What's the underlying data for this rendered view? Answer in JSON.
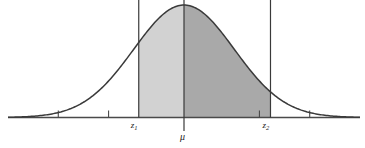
{
  "figure": {
    "kind": "normal-distribution-curve",
    "background": "#ffffff",
    "curve_color": "#3a3a3a",
    "axis_color": "#4a4a4a",
    "fill_left": "#d2d2d2",
    "fill_right": "#a9a9a9"
  },
  "labels": {
    "z1": "z",
    "z1_sub": "1",
    "mu": "μ",
    "z2": "z",
    "z2_sub": "2"
  },
  "chart_data": {
    "type": "line",
    "title": "",
    "xlabel": "",
    "ylabel": "",
    "subtitle": "",
    "grid": false,
    "legend": false,
    "distribution": "normal",
    "mean_label": "μ",
    "mean_x": 0,
    "sigma": 1,
    "xlim": [
      -3.5,
      3.5
    ],
    "ylim": [
      0,
      1
    ],
    "axis_ticks": [
      -2.5,
      -1.5,
      1.5,
      2.5
    ],
    "axis_tick_labels": [
      "",
      "",
      "",
      ""
    ],
    "markers": [
      {
        "name": "z1",
        "label": "z₁",
        "x": -0.9
      },
      {
        "name": "mu",
        "label": "μ",
        "x": 0
      },
      {
        "name": "z2",
        "label": "z₂",
        "x": 1.72
      }
    ],
    "shaded_regions": [
      {
        "name": "region-z1-to-mu",
        "from": -0.9,
        "to": 0,
        "color": "#d2d2d2"
      },
      {
        "name": "region-mu-to-z2",
        "from": 0,
        "to": 1.72,
        "color": "#a9a9a9"
      }
    ],
    "series": [
      {
        "name": "normal-pdf",
        "x": [
          -3.5,
          -3.25,
          -3,
          -2.75,
          -2.5,
          -2.25,
          -2,
          -1.75,
          -1.5,
          -1.25,
          -1,
          -0.75,
          -0.5,
          -0.25,
          0,
          0.25,
          0.5,
          0.75,
          1,
          1.25,
          1.5,
          1.75,
          2,
          2.25,
          2.5,
          2.75,
          3,
          3.25,
          3.5
        ],
        "values": [
          0.0022,
          0.0051,
          0.0111,
          0.0224,
          0.0439,
          0.0796,
          0.1353,
          0.2163,
          0.3247,
          0.4578,
          0.6065,
          0.7548,
          0.8825,
          0.9692,
          1.0,
          0.9692,
          0.8825,
          0.7548,
          0.6065,
          0.4578,
          0.3247,
          0.2163,
          0.1353,
          0.0796,
          0.0439,
          0.0224,
          0.0111,
          0.0051,
          0.0022
        ]
      }
    ]
  }
}
